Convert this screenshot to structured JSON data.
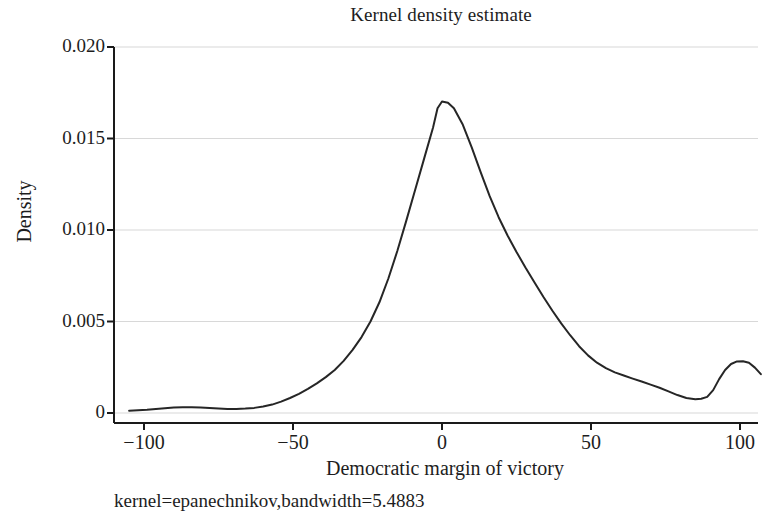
{
  "chart_data": {
    "type": "line",
    "title": "Kernel density estimate",
    "xlabel": "Democratic margin of victory",
    "ylabel": "Density",
    "footnote": "kernel=epanechnikov,bandwidth=5.4883",
    "xlim": [
      -107,
      110
    ],
    "ylim": [
      0,
      0.0205
    ],
    "xticks": [
      -100,
      -50,
      0,
      50,
      100
    ],
    "xtick_labels": [
      "−100",
      "−50",
      "0",
      "50",
      "100"
    ],
    "yticks": [
      0,
      0.005,
      0.01,
      0.015,
      0.02
    ],
    "ytick_labels": [
      "0",
      "0.005",
      "0.010",
      "0.015",
      "0.020"
    ],
    "grid": "horizontal",
    "grid_color": "#d8d8d8",
    "line_color": "#262626",
    "line_width": 2.0,
    "axis_color": "#1a1a1a",
    "background": "#ffffff",
    "series": [
      {
        "name": "Density",
        "x": [
          -105,
          -102,
          -99,
          -96,
          -93,
          -90,
          -87,
          -84,
          -81,
          -78,
          -75,
          -72,
          -69,
          -66,
          -63,
          -60,
          -57,
          -54,
          -51,
          -48,
          -45,
          -42,
          -39,
          -36,
          -33,
          -30,
          -27,
          -24,
          -21,
          -18,
          -15,
          -12,
          -9,
          -6,
          -3,
          -1.5,
          0,
          2,
          4,
          7,
          10,
          13,
          16,
          19,
          22,
          25,
          28,
          31,
          34,
          37,
          40,
          43,
          46,
          49,
          52,
          55,
          58,
          61,
          64,
          67,
          70,
          73,
          76,
          79,
          82,
          85,
          87,
          89,
          91,
          93,
          95,
          97,
          99,
          101,
          103,
          105,
          107
        ],
        "y": [
          0.00012,
          0.00015,
          0.00018,
          0.00022,
          0.00026,
          0.0003,
          0.00031,
          0.00031,
          0.0003,
          0.00027,
          0.00024,
          0.00022,
          0.00022,
          0.00024,
          0.00028,
          0.00035,
          0.00046,
          0.00062,
          0.00082,
          0.00105,
          0.00132,
          0.00162,
          0.00196,
          0.00235,
          0.00285,
          0.00345,
          0.00415,
          0.005,
          0.00605,
          0.00735,
          0.00885,
          0.0105,
          0.0122,
          0.0139,
          0.0156,
          0.01665,
          0.01702,
          0.01695,
          0.01665,
          0.01575,
          0.0145,
          0.01315,
          0.01185,
          0.0107,
          0.0097,
          0.0088,
          0.00795,
          0.00715,
          0.00635,
          0.0056,
          0.0049,
          0.00425,
          0.00365,
          0.00315,
          0.00275,
          0.00245,
          0.00222,
          0.00205,
          0.00188,
          0.00172,
          0.00155,
          0.00138,
          0.00118,
          0.00098,
          0.00082,
          0.00075,
          0.00078,
          0.00088,
          0.00125,
          0.00185,
          0.00235,
          0.00268,
          0.00282,
          0.00283,
          0.00275,
          0.00248,
          0.00212
        ]
      }
    ]
  },
  "icons": {
    "tick_mark": "tick-mark"
  }
}
